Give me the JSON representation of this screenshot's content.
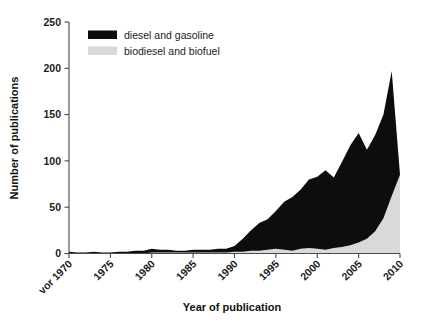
{
  "chart_data": {
    "type": "area",
    "stacked": true,
    "title": "",
    "xlabel": "Year of publication",
    "ylabel": "Number of publications",
    "ylim": [
      0,
      250
    ],
    "yticks": [
      0,
      50,
      100,
      150,
      200,
      250
    ],
    "ytick_labels": [
      "0",
      "50",
      "100",
      "150",
      "200",
      "250"
    ],
    "xticks": [
      1970,
      1975,
      1980,
      1985,
      1990,
      1995,
      2000,
      2005,
      2010
    ],
    "xtick_labels": [
      "vor 1970",
      "1975",
      "1980",
      "1985",
      "1990",
      "1995",
      "2000",
      "2005",
      "2010"
    ],
    "xlim": [
      1970,
      2010
    ],
    "grid": false,
    "legend_position": "top-left-inside",
    "x": [
      1970,
      1971,
      1972,
      1973,
      1974,
      1975,
      1976,
      1977,
      1978,
      1979,
      1980,
      1981,
      1982,
      1983,
      1984,
      1985,
      1986,
      1987,
      1988,
      1989,
      1990,
      1991,
      1992,
      1993,
      1994,
      1995,
      1996,
      1997,
      1998,
      1999,
      2000,
      2001,
      2002,
      2003,
      2004,
      2005,
      2006,
      2007,
      2008,
      2009,
      2010
    ],
    "series": [
      {
        "name": "biodiesel and biofuel",
        "color": "#d9d9d9",
        "values": [
          0,
          0,
          0,
          0,
          0,
          0,
          0,
          0,
          0,
          0,
          1,
          1,
          1,
          1,
          1,
          1,
          1,
          1,
          1,
          1,
          2,
          2,
          3,
          3,
          4,
          5,
          4,
          3,
          5,
          6,
          5,
          4,
          6,
          7,
          9,
          12,
          16,
          24,
          38,
          62,
          85
        ]
      },
      {
        "name": "diesel and gasoline",
        "color": "#0d0d0d",
        "values": [
          2,
          1,
          1,
          2,
          1,
          1,
          2,
          2,
          3,
          3,
          4,
          3,
          3,
          2,
          2,
          3,
          3,
          3,
          4,
          4,
          6,
          14,
          22,
          30,
          33,
          41,
          52,
          58,
          64,
          74,
          78,
          86,
          76,
          92,
          108,
          118,
          96,
          104,
          112,
          135,
          0
        ]
      }
    ],
    "totals": [
      2,
      1,
      1,
      2,
      1,
      1,
      2,
      2,
      3,
      3,
      5,
      4,
      4,
      3,
      3,
      4,
      4,
      4,
      5,
      5,
      8,
      16,
      25,
      33,
      37,
      46,
      56,
      61,
      69,
      80,
      83,
      90,
      82,
      99,
      117,
      130,
      112,
      128,
      150,
      197,
      85
    ]
  },
  "legend": {
    "items": [
      {
        "label": "diesel and gasoline",
        "color": "#0d0d0d"
      },
      {
        "label": "biodiesel and biofuel",
        "color": "#d9d9d9"
      }
    ]
  }
}
